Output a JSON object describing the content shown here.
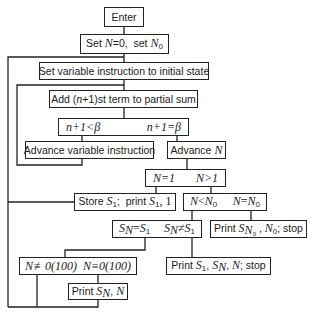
{
  "flowchart": {
    "enter": "Enter",
    "set_n": {
      "part1": "Set ",
      "var1": "N",
      "part2": "=0,  set ",
      "var2": "N",
      "sub2": "0"
    },
    "set_variable": "Set variable instruction to initial state",
    "add_term": {
      "part1": "Add (",
      "var": "n",
      "part2": "+1)st term to partial sum"
    },
    "decision_beta": {
      "left": "n+1<β",
      "right": "n+1=β"
    },
    "advance_variable": "Advance variable instruction",
    "advance_n": {
      "part1": "Advance ",
      "var": "N"
    },
    "decision_n1": {
      "left": "N=1",
      "right": "N>1"
    },
    "store_s1": {
      "part1": "Store ",
      "s": "S",
      "sub": "1",
      "part2": ";  print ",
      "s2": "S",
      "sub2": "1",
      "part3": ", 1"
    },
    "decision_n0": {
      "left_var": "N",
      "left_op": "<",
      "left_var2": "N",
      "left_sub": "0",
      "right_var": "N",
      "right_op": "=",
      "right_var2": "N",
      "right_sub": "0"
    },
    "decision_sn": {
      "left_s": "S",
      "left_sub": "N",
      "left_op": "=",
      "left_s2": "S",
      "left_sub2": "1",
      "right_s": "S",
      "right_sub": "N",
      "right_op": "≠",
      "right_s2": "S",
      "right_sub2": "1"
    },
    "print_sn0": {
      "part1": "Print ",
      "s": "S",
      "sub": "N",
      "subsub": "0",
      "part2": " , ",
      "n": "N",
      "nsub": "0",
      "part3": "; stop"
    },
    "decision_mod": {
      "left": "N≢0(100)",
      "right": "N≡0(100)"
    },
    "print_s1_sn": {
      "part1": "Print ",
      "s1": "S",
      "sub1": "1",
      "comma1": ", ",
      "sn": "S",
      "subn": "N",
      "comma2": ", ",
      "n": "N",
      "part2": "; stop"
    },
    "print_sn_n": {
      "part1": "Print ",
      "s": "S",
      "sub": "N",
      "comma": ", ",
      "n": "N"
    }
  },
  "colors": {
    "line": "#222222",
    "background": "#ffffff"
  }
}
